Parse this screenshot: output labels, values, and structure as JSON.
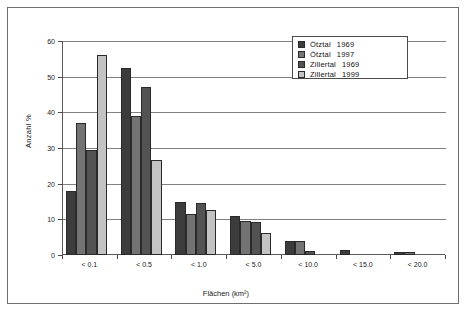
{
  "chart_data": {
    "type": "bar",
    "title": "",
    "xlabel": "Flächen (km²)",
    "ylabel": "Anzahl %",
    "ylim": [
      0,
      60
    ],
    "yticks": [
      0,
      10,
      20,
      30,
      40,
      50,
      60
    ],
    "grid": true,
    "legend_position": "top-right",
    "categories": [
      "< 0.1",
      "< 0.5",
      "< 1.0",
      "< 5.0",
      "< 10.0",
      "< 15.0",
      "< 20.0"
    ],
    "series": [
      {
        "name": "Ötztal 1969",
        "region": "Ötztal",
        "year": "1969",
        "color": "#3c3c3c",
        "values": [
          18.0,
          52.5,
          15.0,
          10.8,
          4.0,
          1.3,
          0.9
        ]
      },
      {
        "name": "Ötztal 1997",
        "region": "Ötztal",
        "year": "1997",
        "color": "#737373",
        "values": [
          37.0,
          39.0,
          11.5,
          9.5,
          4.0,
          0.0,
          0.8
        ]
      },
      {
        "name": "Zillertal 1969",
        "region": "Zillertal",
        "year": "1969",
        "color": "#535353",
        "values": [
          29.5,
          47.0,
          14.5,
          9.3,
          1.0,
          0.0,
          0.0
        ]
      },
      {
        "name": "Zillertal 1999",
        "region": "Zillertal",
        "year": "1999",
        "color": "#c3c3c3",
        "values": [
          56.0,
          26.5,
          12.5,
          6.3,
          0.0,
          0.0,
          0.0
        ]
      }
    ]
  },
  "legend": {
    "entries": [
      {
        "label": "Ötztal",
        "year": "1969"
      },
      {
        "label": "Ötztal",
        "year": "1997"
      },
      {
        "label": "Zillertal",
        "year": "1969"
      },
      {
        "label": "Zillertal",
        "year": "1999"
      }
    ]
  }
}
